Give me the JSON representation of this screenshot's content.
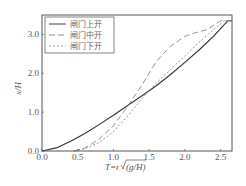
{
  "chart_data": {
    "type": "line",
    "title": "",
    "xlabel": "T=t√(g/H)",
    "ylabel": "x/H",
    "xlim": [
      0.0,
      2.66
    ],
    "ylim": [
      0.0,
      3.5
    ],
    "xticks": [
      "0.0",
      "0.5",
      "1.0",
      "1.5",
      "2.0",
      "2.5"
    ],
    "yticks": [
      "0.0",
      "1.0",
      "2.0",
      "3.0"
    ],
    "grid": false,
    "legend_position": "upper left",
    "series": [
      {
        "name": "闸门上开",
        "style": "solid",
        "x": [
          0.0,
          0.2,
          0.4,
          0.6,
          0.8,
          1.0,
          1.2,
          1.4,
          1.6,
          1.8,
          2.0,
          2.2,
          2.4,
          2.6,
          2.66
        ],
        "y": [
          0.0,
          0.08,
          0.25,
          0.45,
          0.68,
          0.92,
          1.17,
          1.42,
          1.68,
          1.97,
          2.28,
          2.6,
          2.95,
          3.35,
          3.35
        ]
      },
      {
        "name": "闸门中开",
        "style": "longdash",
        "x": [
          0.45,
          0.6,
          0.8,
          1.0,
          1.2,
          1.4,
          1.5,
          1.6,
          1.8,
          2.0,
          2.1,
          2.3,
          2.5,
          2.66
        ],
        "y": [
          0.0,
          0.08,
          0.3,
          0.65,
          1.15,
          1.7,
          2.0,
          2.3,
          2.7,
          2.95,
          3.02,
          3.12,
          3.35,
          3.35
        ]
      },
      {
        "name": "闸门下开",
        "style": "shortdash",
        "x": [
          0.45,
          0.6,
          0.8,
          1.0,
          1.2,
          1.4,
          1.6,
          1.8,
          2.0,
          2.2,
          2.4,
          2.55,
          2.66
        ],
        "y": [
          0.0,
          0.06,
          0.22,
          0.5,
          0.9,
          1.35,
          1.75,
          2.1,
          2.45,
          2.8,
          3.12,
          3.35,
          3.35
        ]
      }
    ]
  },
  "axes": {
    "x_label_main": "T=t",
    "x_label_sqrt": "(g/H)",
    "y_label": "x/H"
  },
  "legend": {
    "items": [
      "闸门上开",
      "闸门中开",
      "闸门下开"
    ]
  }
}
